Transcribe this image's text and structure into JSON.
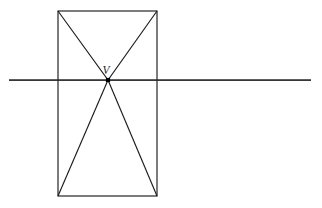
{
  "figure": {
    "background_color": "#ffffff",
    "stroke_color": "#1d1d1d",
    "axis_color": "#2a2a2a",
    "vertex_color": "#000000",
    "canvas": {
      "width": 322,
      "height": 208
    },
    "labels": {
      "vertex": "V"
    },
    "geometry": {
      "rectangle": {
        "name": "bounding-rectangle",
        "x": 58,
        "y": 11,
        "width": 99,
        "height": 185,
        "corners": {
          "top_left": [
            58,
            11
          ],
          "top_right": [
            157,
            11
          ],
          "bottom_right": [
            157,
            196
          ],
          "bottom_left": [
            58,
            196
          ]
        }
      },
      "vertex_point": {
        "name": "apex-V",
        "x": 108,
        "y": 80,
        "marker": "filled-square",
        "marker_size": 4.2
      },
      "vertex_label_position": {
        "x": 106,
        "y": 74
      },
      "horizontal_axis": {
        "name": "horizontal-axis-line",
        "x1": 9,
        "y1": 80,
        "x2": 311,
        "y2": 80
      },
      "upper_triangle": {
        "name": "upper-triangle",
        "points": "58,11 108,80 157,11"
      },
      "lower_triangle": {
        "name": "lower-triangle",
        "points": "108,80 58,196 157,196"
      }
    }
  }
}
